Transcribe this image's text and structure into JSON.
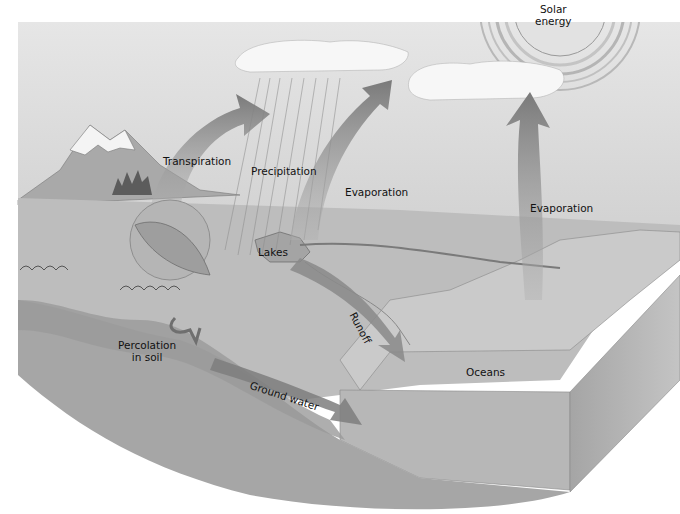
{
  "diagram": {
    "labels": {
      "solar_energy_line1": "Solar",
      "solar_energy_line2": "energy",
      "transpiration": "Transpiration",
      "precipitation": "Precipitation",
      "evaporation_center": "Evaporation",
      "evaporation_right": "Evaporation",
      "lakes": "Lakes",
      "runoff": "Runoff",
      "percolation_line1": "Percolation",
      "percolation_line2": "in soil",
      "ground_water": "Ground water",
      "oceans": "Oceans"
    },
    "colors": {
      "sky": "#d9d9d9",
      "cloud": "#f7f7f7",
      "land": "#bdbdbd",
      "ocean_top": "#c9c9c9",
      "block_side": "#a9a9a9",
      "arrow": "#8a8a8a",
      "arrow_dark": "#6a6a6a",
      "text": "#111111"
    }
  }
}
